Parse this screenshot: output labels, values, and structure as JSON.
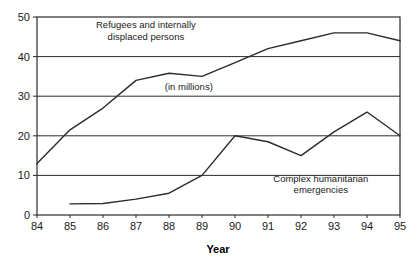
{
  "chart_data": {
    "type": "line",
    "title": "",
    "subtitle": "",
    "xlabel": "Year",
    "ylabel": "",
    "unit_note": "(in millions)",
    "x": [
      84,
      85,
      86,
      87,
      88,
      89,
      90,
      91,
      92,
      93,
      94,
      95
    ],
    "xtick_labels": [
      "84",
      "85",
      "86",
      "87",
      "88",
      "89",
      "90",
      "91",
      "92",
      "93",
      "94",
      "95"
    ],
    "ytick_labels": [
      "0",
      "10",
      "20",
      "30",
      "40",
      "50"
    ],
    "yticks": [
      0,
      10,
      20,
      30,
      40,
      50
    ],
    "xlim": [
      84,
      95
    ],
    "ylim": [
      0,
      50
    ],
    "grid": "horizontal",
    "legend_position": "inline-annotations",
    "series": [
      {
        "name": "Refugees and internally displaced persons",
        "x": [
          84,
          85,
          86,
          87,
          88,
          89,
          90,
          91,
          92,
          93,
          94,
          95
        ],
        "values": [
          13,
          21.5,
          27,
          34,
          35.8,
          35,
          38.5,
          42,
          44,
          46,
          46,
          44
        ]
      },
      {
        "name": "Complex humanitarian emergencies",
        "x": [
          85,
          86,
          87,
          88,
          89,
          90,
          91,
          92,
          93,
          94,
          95
        ],
        "values": [
          2.8,
          2.9,
          4,
          5.5,
          10,
          20,
          18.5,
          15,
          21,
          26,
          20
        ]
      }
    ],
    "annotations": [
      {
        "id": "refugees-label",
        "lines": [
          "Refugees and internally",
          "displaced persons"
        ],
        "x": 87.3,
        "y": 47.2
      },
      {
        "id": "millions-label",
        "lines": [
          "(in millions)"
        ],
        "x": 88.6,
        "y": 31.5
      },
      {
        "id": "emergencies-label",
        "lines": [
          "Complex humanitarian",
          "emergencies"
        ],
        "x": 92.6,
        "y": 8.4
      }
    ],
    "colors": {
      "line": "#2b2b2b",
      "grid": "#2b2b2b",
      "background": "#ffffff",
      "text": "#1a1a1a"
    }
  }
}
